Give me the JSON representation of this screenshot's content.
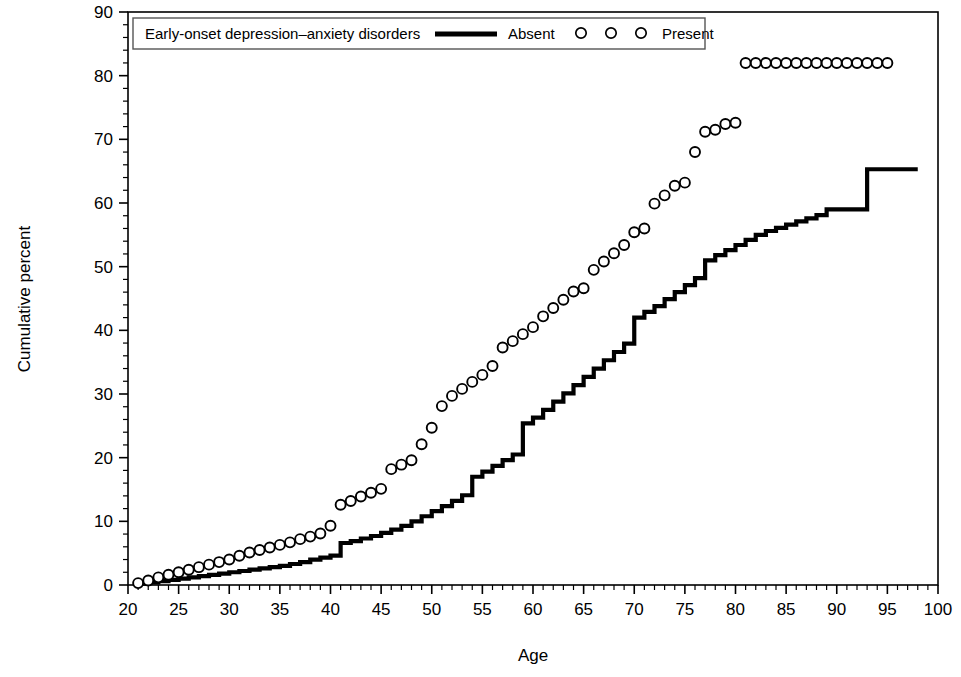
{
  "chart_data": {
    "type": "line",
    "title": "",
    "xlabel": "Age",
    "ylabel": "Cumulative percent",
    "xlim": [
      20,
      100
    ],
    "ylim": [
      0,
      90
    ],
    "xticks": [
      20,
      25,
      30,
      35,
      40,
      45,
      50,
      55,
      60,
      65,
      70,
      75,
      80,
      85,
      90,
      95,
      100
    ],
    "yticks": [
      0,
      10,
      20,
      30,
      40,
      50,
      60,
      70,
      80,
      90
    ],
    "xtick_labels": [
      "20",
      "25",
      "30",
      "35",
      "40",
      "45",
      "50",
      "55",
      "60",
      "65",
      "70",
      "75",
      "80",
      "85",
      "90",
      "95",
      "100"
    ],
    "ytick_labels": [
      "0",
      "10",
      "20",
      "30",
      "40",
      "50",
      "60",
      "70",
      "80",
      "90"
    ],
    "minor_tick_interval_x": 1,
    "minor_tick_interval_y": 2,
    "grid": false,
    "legend_position": "top-left-inside",
    "legend_title": "Early-onset depression–anxiety disorders",
    "series": [
      {
        "name": "Absent",
        "marker": "line",
        "style": "step",
        "color": "#000000",
        "x": [
          21,
          22,
          23,
          24,
          25,
          26,
          27,
          28,
          29,
          30,
          31,
          32,
          33,
          34,
          35,
          36,
          37,
          38,
          39,
          40,
          41,
          42,
          43,
          44,
          45,
          46,
          47,
          48,
          49,
          50,
          51,
          52,
          53,
          54,
          55,
          56,
          57,
          58,
          59,
          60,
          61,
          62,
          63,
          64,
          65,
          66,
          67,
          68,
          69,
          70,
          71,
          72,
          73,
          74,
          75,
          76,
          77,
          78,
          79,
          80,
          81,
          82,
          83,
          84,
          85,
          86,
          87,
          88,
          89,
          90,
          91,
          92,
          93,
          94,
          95,
          96,
          97,
          98
        ],
        "values": [
          0.2,
          0.4,
          0.6,
          0.8,
          1.0,
          1.2,
          1.4,
          1.6,
          1.8,
          2.0,
          2.2,
          2.4,
          2.6,
          2.8,
          3.0,
          3.3,
          3.6,
          4.0,
          4.3,
          4.6,
          6.6,
          6.9,
          7.3,
          7.7,
          8.2,
          8.7,
          9.3,
          10.0,
          10.8,
          11.6,
          12.4,
          13.2,
          14.1,
          17.0,
          17.8,
          18.7,
          19.6,
          20.5,
          25.4,
          26.3,
          27.5,
          28.8,
          30.1,
          31.4,
          32.7,
          34.0,
          35.3,
          36.6,
          37.9,
          42.0,
          42.9,
          43.8,
          44.9,
          46.0,
          47.1,
          48.2,
          51.0,
          51.8,
          52.6,
          53.4,
          54.2,
          55.0,
          55.6,
          56.1,
          56.6,
          57.1,
          57.6,
          58.1,
          59.0,
          59.0,
          59.0,
          59.0,
          65.3,
          65.3,
          65.3,
          65.3,
          65.3,
          65.3
        ]
      },
      {
        "name": "Present",
        "marker": "open-circle",
        "style": "markers",
        "color": "#000000",
        "x": [
          21,
          22,
          23,
          24,
          25,
          26,
          27,
          28,
          29,
          30,
          31,
          32,
          33,
          34,
          35,
          36,
          37,
          38,
          39,
          40,
          41,
          42,
          43,
          44,
          45,
          46,
          47,
          48,
          49,
          50,
          51,
          52,
          53,
          54,
          55,
          56,
          57,
          58,
          59,
          60,
          61,
          62,
          63,
          64,
          65,
          66,
          67,
          68,
          69,
          70,
          71,
          72,
          73,
          74,
          75,
          76,
          77,
          78,
          79,
          80,
          81,
          82,
          83,
          84,
          85,
          86,
          87,
          88,
          89,
          90,
          91,
          92,
          93,
          94,
          95
        ],
        "values": [
          0.3,
          0.7,
          1.2,
          1.6,
          2.0,
          2.4,
          2.8,
          3.2,
          3.6,
          4.0,
          4.6,
          5.1,
          5.5,
          5.9,
          6.3,
          6.7,
          7.2,
          7.6,
          8.1,
          9.3,
          12.6,
          13.2,
          13.9,
          14.5,
          15.1,
          18.2,
          18.9,
          19.6,
          22.1,
          24.7,
          28.1,
          29.7,
          30.8,
          31.9,
          33.0,
          34.4,
          37.3,
          38.3,
          39.4,
          40.5,
          42.2,
          43.5,
          44.8,
          46.1,
          46.6,
          49.5,
          50.8,
          52.1,
          53.4,
          55.4,
          56.0,
          59.9,
          61.2,
          62.7,
          63.2,
          68.0,
          71.2,
          71.5,
          72.4,
          72.6,
          82.0,
          82.0,
          82.0,
          82.0,
          82.0,
          82.0,
          82.0,
          82.0,
          82.0,
          82.0,
          82.0,
          82.0,
          82.0,
          82.0,
          82.0
        ]
      }
    ]
  },
  "legend": {
    "label": "Early-onset depression–anxiety disorders",
    "absent_label": "Absent",
    "present_label": "Present"
  },
  "axes": {
    "x_title": "Age",
    "y_title": "Cumulative percent"
  },
  "colors": {
    "line": "#000000",
    "marker_stroke": "#000000",
    "marker_fill": "#ffffff",
    "axis": "#000000",
    "background": "#ffffff"
  }
}
